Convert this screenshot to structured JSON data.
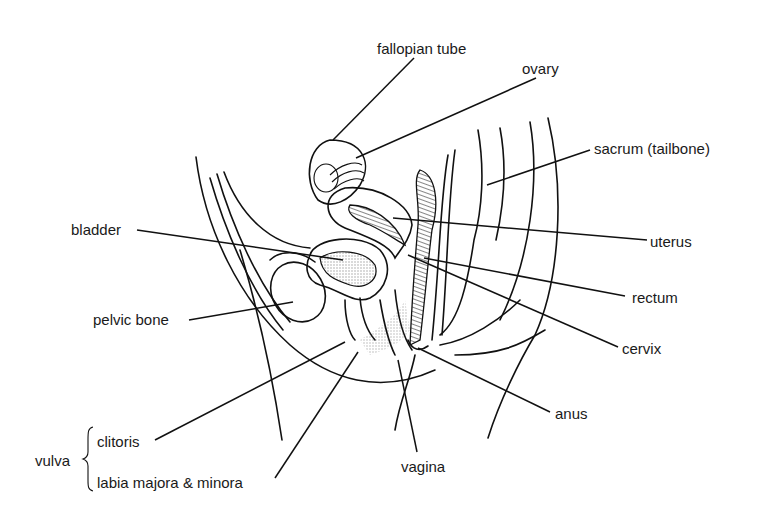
{
  "diagram": {
    "type": "anatomical illustration",
    "labels": {
      "fallopian_tube": "fallopian tube",
      "ovary": "ovary",
      "sacrum": "sacrum (tailbone)",
      "bladder": "bladder",
      "uterus": "uterus",
      "rectum": "rectum",
      "pelvic_bone": "pelvic bone",
      "cervix": "cervix",
      "anus": "anus",
      "vulva": "vulva",
      "clitoris": "clitoris",
      "labia": "labia majora & minora",
      "vagina": "vagina"
    },
    "colors": {
      "line": "#111111",
      "background": "#ffffff",
      "shading": "#555555"
    }
  }
}
